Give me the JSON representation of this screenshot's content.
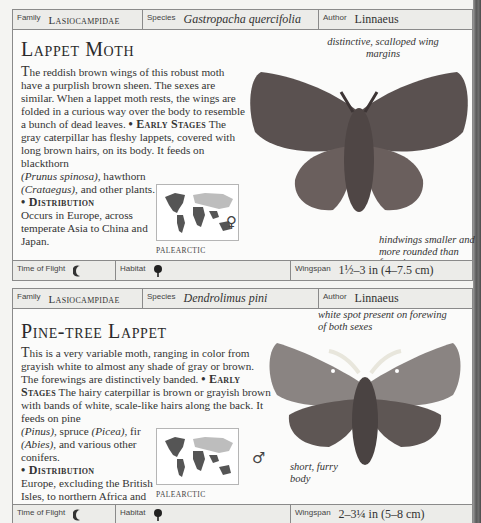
{
  "labels": {
    "family": "Family",
    "species": "Species",
    "author": "Author",
    "time_of_flight": "Time of Flight",
    "habitat": "Habitat",
    "wingspan": "Wingspan"
  },
  "entries": [
    {
      "family": "Lasiocampidae",
      "species": "Gastropacha quercifolia",
      "author": "Linnaeus",
      "title": "Lappet Moth",
      "intro_dropcap": "T",
      "intro": "he reddish brown wings of this robust moth have a purplish brown sheen. The sexes are similar. When a lappet moth rests, the wings are folded in a curious way over the body to resemble a bunch of dead leaves.",
      "early_stages_heading": "• Early Stages",
      "early_stages_a": " The gray caterpillar has fleshy lappets, covered with long brown hairs, on its body. It feeds on blackthorn ",
      "early_stages_b": "(Prunus spinosa)",
      "early_stages_c": ", hawthorn ",
      "early_stages_d": "(Crataegus)",
      "early_stages_e": ", and other plants.",
      "distribution_heading": "• Distribution",
      "distribution": "Occurs in Europe, across temperate Asia to China and Japan.",
      "map_label": "PALEARCTIC",
      "annotations": [
        "distinctive, scalloped wing margins",
        "hindwings smaller and more rounded than forewings"
      ],
      "sex_symbol": "♀",
      "time_of_flight_icon": "moon-icon",
      "habitat_icon": "tree-icon",
      "wingspan": "1½–3 in (4–7.5 cm)"
    },
    {
      "family": "Lasiocampidae",
      "species": "Dendrolimus pini",
      "author": "Linnaeus",
      "title": "Pine-tree Lappet",
      "intro_dropcap": "T",
      "intro": "his is a very variable moth, ranging in color from grayish white to almost any shade of gray or brown. The forewings are distinctively banded.",
      "early_stages_heading": "• Early Stages",
      "early_stages_a": " The hairy caterpillar is brown or grayish brown with bands of white, scale-like hairs along the back. It feeds on pine ",
      "early_stages_b": "(Pinus)",
      "early_stages_c": ", spruce ",
      "early_stages_d": "(Picea)",
      "early_stages_e": ", fir ",
      "early_stages_f": "(Abies)",
      "early_stages_g": ", and various other conifers.",
      "distribution_heading": "• Distribution",
      "distribution": "Europe, excluding the British Isles, to northern Africa and central Asia.",
      "map_label": "PALEARCTIC",
      "annotations": [
        "white spot present on forewing of both sexes",
        "short, furry body"
      ],
      "sex_symbol": "♂",
      "time_of_flight_icon": "moon-icon",
      "habitat_icon": "tree-icon",
      "wingspan": "2–3¼ in (5–8 cm)"
    }
  ],
  "colors": {
    "bar_bg": "#ecece9",
    "border": "#8a8a8a",
    "page_bg": "#fbfbfa",
    "moth1": "#5a5150",
    "moth2": "#6a6462"
  }
}
